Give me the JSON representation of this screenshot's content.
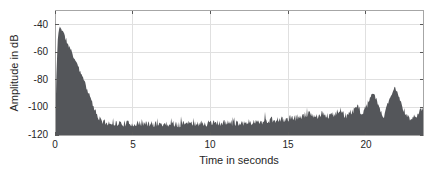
{
  "chart_data": {
    "type": "area",
    "title": "",
    "xlabel": "Time in seconds",
    "ylabel": "Amplitude in dB",
    "xlim": [
      0,
      23.7
    ],
    "ylim": [
      -120,
      -30
    ],
    "xticks": [
      0,
      5,
      10,
      15,
      20
    ],
    "xtick_labels": [
      "0",
      "5",
      "10",
      "15",
      "20"
    ],
    "yticks": [
      -40,
      -60,
      -80,
      -100,
      -120
    ],
    "ytick_labels": [
      "-40",
      "-60",
      "-80",
      "-100",
      "-120"
    ],
    "grid": true,
    "legend": null,
    "series": [
      {
        "name": "amplitude-envelope",
        "units": "dB",
        "envelope_db": [
          [
            0.0,
            -110
          ],
          [
            0.04,
            -103
          ],
          [
            0.1,
            -72
          ],
          [
            0.18,
            -50
          ],
          [
            0.3,
            -40
          ],
          [
            0.5,
            -44
          ],
          [
            0.7,
            -50
          ],
          [
            1.0,
            -57
          ],
          [
            1.3,
            -65
          ],
          [
            1.6,
            -73
          ],
          [
            1.9,
            -81
          ],
          [
            2.2,
            -90
          ],
          [
            2.5,
            -99
          ],
          [
            2.75,
            -105
          ],
          [
            2.95,
            -109
          ],
          [
            3.2,
            -111
          ],
          [
            4.0,
            -111.5
          ],
          [
            6.0,
            -112
          ],
          [
            8.0,
            -112
          ],
          [
            10.0,
            -111.5
          ],
          [
            12.0,
            -111
          ],
          [
            13.0,
            -110.5
          ],
          [
            13.8,
            -109.5
          ],
          [
            14.5,
            -109
          ],
          [
            15.2,
            -108
          ],
          [
            15.7,
            -107
          ],
          [
            16.1,
            -105.5
          ],
          [
            16.5,
            -104.5
          ],
          [
            16.8,
            -107
          ],
          [
            17.2,
            -103.5
          ],
          [
            17.6,
            -106.5
          ],
          [
            18.0,
            -104.5
          ],
          [
            18.35,
            -101.5
          ],
          [
            18.7,
            -106
          ],
          [
            19.05,
            -103.5
          ],
          [
            19.45,
            -99.5
          ],
          [
            19.8,
            -104.5
          ],
          [
            20.05,
            -99
          ],
          [
            20.3,
            -92.5
          ],
          [
            20.5,
            -90.5
          ],
          [
            20.65,
            -93.5
          ],
          [
            20.9,
            -102
          ],
          [
            21.15,
            -106.5
          ],
          [
            21.45,
            -97
          ],
          [
            21.7,
            -90
          ],
          [
            21.85,
            -85.5
          ],
          [
            22.0,
            -88
          ],
          [
            22.2,
            -95
          ],
          [
            22.45,
            -102
          ],
          [
            22.7,
            -107
          ],
          [
            22.95,
            -108.5
          ],
          [
            23.2,
            -106
          ],
          [
            23.45,
            -103.5
          ],
          [
            23.7,
            -101.5
          ]
        ],
        "noise_jitter_db": 2.4,
        "peak_jitter_db": 1.4,
        "spike_extra_db": 3.5,
        "noise_seed": 11
      }
    ],
    "colors": {
      "signal": "#54565a",
      "grid": "#e0e0e0",
      "axis_border": "#a6a6a6",
      "tick": "#595959",
      "text": "#262626",
      "background": "#ffffff"
    }
  }
}
